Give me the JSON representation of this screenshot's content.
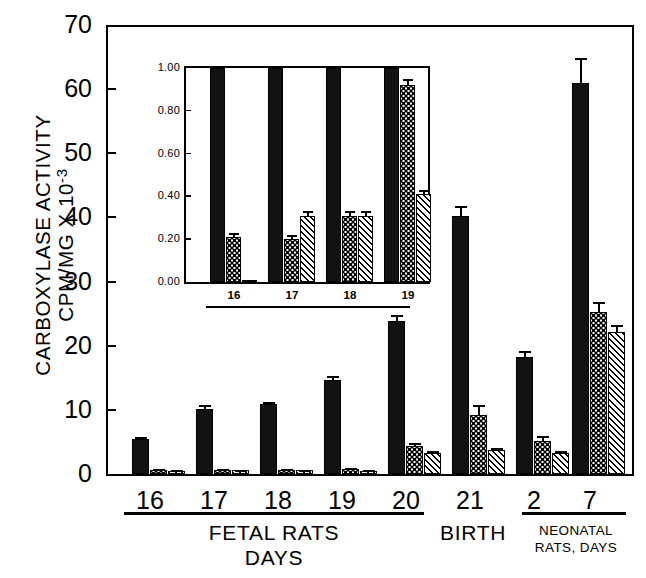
{
  "figure": {
    "background_color": "#ffffff",
    "ink_color": "#000000"
  },
  "axis": {
    "ylabel_line1": "CARBOXYLASE ACTIVITY",
    "ylabel_line2": "CPM/MG X 10",
    "ylabel_exponent": "-3",
    "yticks": [
      "0",
      "10",
      "20",
      "30",
      "40",
      "50",
      "60",
      "70"
    ],
    "xticks": [
      "16",
      "17",
      "18",
      "19",
      "20",
      "21",
      "2",
      "7"
    ]
  },
  "annotations": {
    "fetal_rats": "FETAL RATS",
    "days": "DAYS",
    "birth": "BIRTH",
    "neonatal_line1": "NEONATAL",
    "neonatal_line2": "RATS, DAYS"
  },
  "inset": {
    "yticks": [
      "0.00",
      "0.20",
      "0.40",
      "0.60",
      "0.80",
      "1.00"
    ],
    "xticks": [
      "16",
      "17",
      "18",
      "19"
    ]
  },
  "chart_data": {
    "type": "bar",
    "title": "",
    "xlabel": "FETAL RATS DAYS / BIRTH / NEONATAL RATS, DAYS",
    "ylabel": "CARBOXYLASE ACTIVITY CPM/MG X 10-3",
    "ylim": [
      0,
      70
    ],
    "yticks": [
      0,
      10,
      20,
      30,
      40,
      50,
      60,
      70
    ],
    "grid": false,
    "legend": "none",
    "categories": [
      "16",
      "17",
      "18",
      "19",
      "20",
      "21",
      "2",
      "7"
    ],
    "series": [
      {
        "name": "solid-black",
        "pattern": "solid",
        "values": [
          5.4,
          10.2,
          10.9,
          14.7,
          23.9,
          40.2,
          18.2,
          61.0
        ],
        "errors": [
          0.3,
          0.5,
          0.4,
          0.6,
          0.9,
          1.6,
          1.0,
          3.8
        ]
      },
      {
        "name": "dotted",
        "pattern": "dotted",
        "values": [
          0.7,
          0.7,
          0.7,
          0.8,
          4.4,
          9.2,
          5.2,
          25.2
        ],
        "errors": [
          0.1,
          0.1,
          0.1,
          0.1,
          0.5,
          1.5,
          0.8,
          1.6
        ]
      },
      {
        "name": "hatched",
        "pattern": "hatched",
        "values": [
          0.4,
          0.6,
          0.6,
          0.5,
          3.3,
          3.7,
          3.3,
          22.2
        ],
        "errors": [
          0.1,
          0.1,
          0.1,
          0.1,
          0.3,
          0.3,
          0.3,
          1.0
        ]
      }
    ],
    "inset": {
      "type": "bar",
      "ylim": [
        0,
        1.0
      ],
      "yticks": [
        0.0,
        0.2,
        0.4,
        0.6,
        0.8,
        1.0
      ],
      "categories": [
        "16",
        "17",
        "18",
        "19"
      ],
      "series": [
        {
          "name": "solid-black",
          "pattern": "solid",
          "values": [
            1.0,
            1.0,
            1.0,
            1.0
          ],
          "errors": [
            0,
            0,
            0,
            0
          ]
        },
        {
          "name": "dotted",
          "pattern": "dotted",
          "values": [
            0.21,
            0.2,
            0.31,
            0.92
          ],
          "errors": [
            0.02,
            0.02,
            0.02,
            0.03
          ]
        },
        {
          "name": "hatched",
          "pattern": "hatched",
          "values": [
            0.01,
            0.31,
            0.31,
            0.41
          ],
          "errors": [
            0.0,
            0.02,
            0.02,
            0.02
          ]
        }
      ]
    }
  }
}
